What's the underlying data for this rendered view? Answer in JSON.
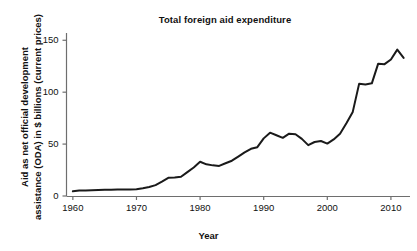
{
  "chart_data": {
    "type": "line",
    "title": "Total foreign aid expenditure",
    "xlabel": "Year",
    "ylabel_line1": "Aid as net official development",
    "ylabel_line2": "assistance (ODA) in $ billions (current prices)",
    "ylabel": "Aid as net official development assistance (ODA) in $ billions (current prices)",
    "grid": false,
    "legend": "none",
    "line_color": "#1a1a1a",
    "axis_color": "#6e6e6e",
    "background": "#ffffff",
    "xlim": [
      1959,
      2013
    ],
    "ylim": [
      0,
      157
    ],
    "xticks": [
      1960,
      1970,
      1980,
      1990,
      2000,
      2010
    ],
    "xtick_labels": [
      "1960",
      "1970",
      "1980",
      "1990",
      "2000",
      "2010"
    ],
    "yticks": [
      0,
      50,
      100,
      150
    ],
    "ytick_labels": [
      "0",
      "50",
      "100",
      "150"
    ],
    "x": [
      1960,
      1961,
      1962,
      1963,
      1964,
      1965,
      1966,
      1967,
      1968,
      1969,
      1970,
      1971,
      1972,
      1973,
      1974,
      1975,
      1976,
      1977,
      1978,
      1979,
      1980,
      1981,
      1982,
      1983,
      1984,
      1985,
      1986,
      1987,
      1988,
      1989,
      1990,
      1991,
      1992,
      1993,
      1994,
      1995,
      1996,
      1997,
      1998,
      1999,
      2000,
      2001,
      2002,
      2003,
      2004,
      2005,
      2006,
      2007,
      2008,
      2009,
      2010,
      2011,
      2012
    ],
    "values": [
      4.5,
      5.2,
      5.4,
      5.6,
      5.7,
      5.9,
      6.0,
      6.2,
      6.2,
      6.3,
      6.6,
      7.5,
      8.6,
      10.5,
      13.8,
      17.5,
      17.9,
      18.5,
      23.0,
      27.5,
      33.0,
      30.5,
      29.5,
      29.0,
      31.5,
      34.0,
      38.0,
      42.0,
      45.5,
      47.0,
      55.5,
      61.0,
      58.5,
      56.0,
      60.0,
      59.5,
      55.0,
      49.0,
      52.0,
      53.0,
      50.5,
      54.5,
      60.0,
      70.0,
      81.0,
      108.0,
      107.5,
      108.5,
      127.5,
      127.0,
      131.5,
      141.0,
      133.0
    ],
    "units": "$ billions (current prices)"
  }
}
